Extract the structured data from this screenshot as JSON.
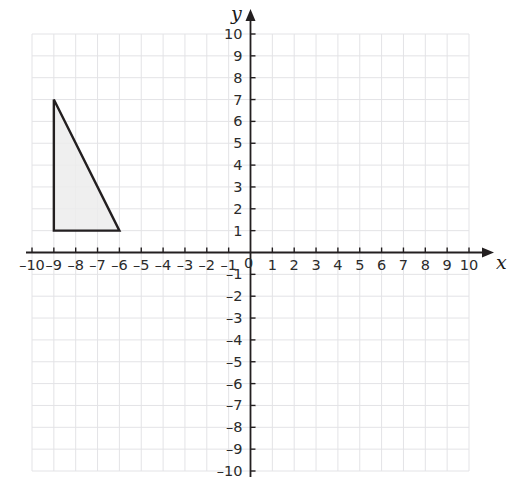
{
  "figure": {
    "kind": "coordinate-plane",
    "background_color": "#ffffff",
    "grid_color": "#e3e3e6",
    "axis_color": "#231f20",
    "tick_label_color": "#2b2b2b"
  },
  "axes": {
    "x_axis_label": "x",
    "y_axis_label": "y",
    "origin_label": "0",
    "x_ticks": [
      -10,
      -9,
      -8,
      -7,
      -6,
      -5,
      -4,
      -3,
      -2,
      -1,
      1,
      2,
      3,
      4,
      5,
      6,
      7,
      8,
      9,
      10
    ],
    "y_ticks": [
      10,
      9,
      8,
      7,
      6,
      5,
      4,
      3,
      2,
      1,
      -1,
      -2,
      -3,
      -4,
      -5,
      -6,
      -7,
      -8,
      -9,
      -10
    ],
    "x_tick_labels": [
      "–10",
      "–9",
      "–8",
      "–7",
      "–6",
      "–5",
      "–4",
      "–3",
      "–2",
      "–1",
      "1",
      "2",
      "3",
      "4",
      "5",
      "6",
      "7",
      "8",
      "9",
      "10"
    ],
    "y_tick_labels": [
      "10",
      "9",
      "8",
      "7",
      "6",
      "5",
      "4",
      "3",
      "2",
      "1",
      "–1",
      "–2",
      "–3",
      "–4",
      "–5",
      "–6",
      "–7",
      "–8",
      "–9",
      "–10"
    ]
  },
  "chart_data": {
    "type": "scatter",
    "title": "",
    "xlabel": "x",
    "ylabel": "y",
    "xlim": [
      -10,
      10
    ],
    "ylim": [
      -10,
      10
    ],
    "grid": true,
    "legend": "none",
    "x_tick_values": [
      -10,
      -9,
      -8,
      -7,
      -6,
      -5,
      -4,
      -3,
      -2,
      -1,
      0,
      1,
      2,
      3,
      4,
      5,
      6,
      7,
      8,
      9,
      10
    ],
    "y_tick_values": [
      -10,
      -9,
      -8,
      -7,
      -6,
      -5,
      -4,
      -3,
      -2,
      -1,
      0,
      1,
      2,
      3,
      4,
      5,
      6,
      7,
      8,
      9,
      10
    ],
    "shapes": [
      {
        "name": "triangle",
        "type": "polygon",
        "vertices": [
          [
            -9,
            7
          ],
          [
            -9,
            1
          ],
          [
            -6,
            1
          ]
        ],
        "fill": "#ececec",
        "stroke": "#231f20",
        "stroke_width": 2.4
      }
    ]
  }
}
